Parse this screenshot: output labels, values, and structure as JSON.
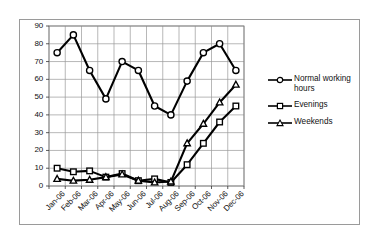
{
  "chart_data": {
    "type": "line",
    "title": "",
    "xlabel": "",
    "ylabel": "",
    "categories": [
      "Jan-06",
      "Feb-06",
      "Mar-06",
      "Apr-06",
      "May-06",
      "Jun-06",
      "Jul-06",
      "Aug-06",
      "Sep-06",
      "Oct-06",
      "Nov-06",
      "Dec-06"
    ],
    "series": [
      {
        "name": "Normal working hours",
        "marker": "circle",
        "values": [
          75,
          85,
          65,
          49,
          70,
          65,
          45,
          40,
          59,
          75,
          80,
          65
        ]
      },
      {
        "name": "Evenings",
        "marker": "square",
        "values": [
          10,
          8,
          8.5,
          5,
          7,
          3,
          4,
          2,
          12,
          24,
          36,
          45
        ]
      },
      {
        "name": "Weekends",
        "marker": "triangle",
        "values": [
          4,
          3,
          3.5,
          5,
          6.5,
          3,
          2,
          2.5,
          24,
          35,
          47,
          57
        ]
      }
    ],
    "ylim": [
      0,
      90
    ],
    "ytick_values": [
      0,
      10,
      20,
      30,
      40,
      50,
      60,
      70,
      80,
      90
    ],
    "ytick_labels": [
      "0",
      "10",
      "20",
      "30",
      "40",
      "50",
      "60",
      "70",
      "80",
      "90"
    ],
    "grid": true,
    "grid_color": "#999999",
    "legend_position": "right",
    "line_color": "#000000",
    "marker_fill": "#ffffff",
    "plot_border_color": "#808080",
    "frame_border_color": "#9a9a9a",
    "background": "#ffffff"
  },
  "legend": {
    "items": [
      {
        "label": "Normal working hours",
        "marker": "circle"
      },
      {
        "label": "Evenings",
        "marker": "square"
      },
      {
        "label": "Weekends",
        "marker": "triangle"
      }
    ]
  }
}
